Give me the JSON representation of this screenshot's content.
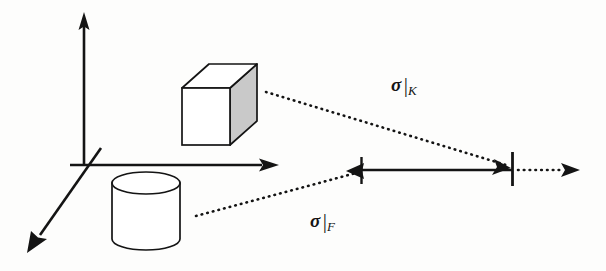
{
  "figure": {
    "background_color": "#fdfdfc",
    "stroke_color": "#141414",
    "cube_shade_color": "#c9c9c9",
    "annotations": [
      {
        "id": "sigma-k",
        "symbol": "σ",
        "bar": "|",
        "subscript": "K",
        "full_text": "σ|K",
        "x": 391,
        "y": 74,
        "describes": "restriction of sigma to K, projection of the cube"
      },
      {
        "id": "sigma-f",
        "symbol": "σ",
        "bar": "|",
        "subscript": "F",
        "full_text": "σ|F",
        "x": 310,
        "y": 210,
        "describes": "restriction of sigma to F, projection of the cylinder"
      }
    ],
    "axes": [
      {
        "name": "vertical-axis",
        "from": [
          84,
          165
        ],
        "to": [
          84,
          14
        ],
        "arrow": "end"
      },
      {
        "name": "horizontal-axis",
        "from": [
          70,
          165
        ],
        "to": [
          278,
          165
        ],
        "arrow": "end"
      },
      {
        "name": "depth-axis",
        "from": [
          100,
          150
        ],
        "to": [
          28,
          252
        ],
        "arrow": "end"
      }
    ],
    "shapes": [
      {
        "name": "cube",
        "type": "cube",
        "front_face": [
          182,
          88,
          48,
          57
        ],
        "depth_offset": [
          27,
          -24
        ],
        "fill": "#ffffff",
        "shade_fill": "#c9c9c9"
      },
      {
        "name": "cylinder",
        "type": "cylinder",
        "bounds": [
          112,
          172,
          68,
          78
        ],
        "ellipse_ry": 11,
        "fill": "#ffffff"
      }
    ],
    "projection_lines": [
      {
        "name": "cube-projection",
        "style": "dotted",
        "from": [
          266,
          92
        ],
        "to": [
          509,
          166
        ]
      },
      {
        "name": "cylinder-projection",
        "style": "dotted",
        "from": [
          196,
          216
        ],
        "to": [
          358,
          173
        ]
      }
    ],
    "measurement_axis": {
      "name": "restriction-axis",
      "y": 170,
      "solid_segment": {
        "from": 361,
        "to": 512
      },
      "dotted_segment": {
        "from": 516,
        "to": 570
      },
      "ticks": [
        {
          "name": "left-tick",
          "x": 361,
          "top": 157,
          "bottom": 184
        },
        {
          "name": "right-tick",
          "x": 512,
          "top": 152,
          "bottom": 186
        }
      ],
      "arrowheads": [
        {
          "name": "left-arrowhead",
          "x": 363,
          "direction": "left"
        },
        {
          "name": "right-arrowhead",
          "x": 510,
          "direction": "right"
        },
        {
          "name": "terminal-arrowhead",
          "x": 578,
          "direction": "right"
        }
      ]
    }
  }
}
